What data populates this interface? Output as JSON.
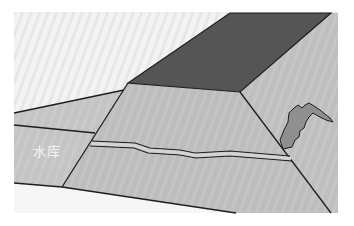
{
  "diagram": {
    "type": "dam-cross-section-illustration",
    "labels": {
      "reservoir": "水库"
    },
    "colors": {
      "background": "#ffffff",
      "sky": "#f2f2f2",
      "crest": "#555555",
      "slope_face": "#bdbdbd",
      "reservoir": "#c2c2c2",
      "ground": "#f7f7f7",
      "seepage": "#8f8f8f",
      "outline": "#1e1e1e"
    },
    "elements": [
      {
        "name": "dam-crest",
        "description": "dark top surface of the dam"
      },
      {
        "name": "upstream-face",
        "description": "front sloping face of the dam facing the reservoir"
      },
      {
        "name": "downstream-face",
        "description": "right sloping face of the dam"
      },
      {
        "name": "reservoir",
        "description": "water area to the left of the dam"
      },
      {
        "name": "crack",
        "description": "horizontal double-line crack across the dam face"
      },
      {
        "name": "seepage-area",
        "description": "irregular wet seepage patch on the downstream face"
      }
    ]
  }
}
